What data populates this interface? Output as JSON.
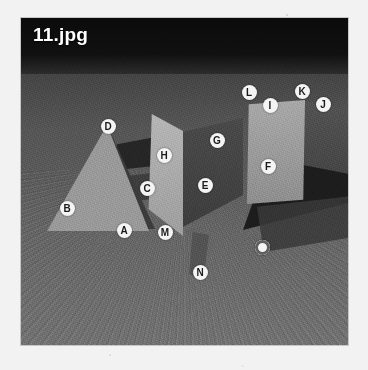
{
  "document": {
    "title": "11.jpg",
    "media_type": "photograph",
    "description": "Grayscale photograph of geometric solids on a textured ground plane with lettered annotation markers"
  },
  "photo": {
    "title_overlay": "11.jpg",
    "background_color": "#6e6e6e",
    "sky_color": "#0b0b0b",
    "ground_color": "#6b6b6b"
  },
  "scene": {
    "objects": [
      {
        "name": "pyramid",
        "position": "left",
        "shade": "light-gray"
      },
      {
        "name": "box",
        "position": "center",
        "shade": "light-gray-and-dark"
      },
      {
        "name": "tall-block",
        "position": "right",
        "shade": "light-gray"
      },
      {
        "name": "cast-shadow",
        "position": "right",
        "shade": "dark"
      }
    ]
  },
  "markers": [
    {
      "label": "A",
      "x": 124,
      "y": 230,
      "style": "letter"
    },
    {
      "label": "B",
      "x": 67,
      "y": 208,
      "style": "letter"
    },
    {
      "label": "C",
      "x": 147,
      "y": 188,
      "style": "letter"
    },
    {
      "label": "D",
      "x": 108,
      "y": 126,
      "style": "letter"
    },
    {
      "label": "E",
      "x": 205,
      "y": 185,
      "style": "letter"
    },
    {
      "label": "F",
      "x": 268,
      "y": 166,
      "style": "letter"
    },
    {
      "label": "G",
      "x": 217,
      "y": 140,
      "style": "letter"
    },
    {
      "label": "H",
      "x": 164,
      "y": 155,
      "style": "letter"
    },
    {
      "label": "I",
      "x": 270,
      "y": 105,
      "style": "letter"
    },
    {
      "label": "J",
      "x": 323,
      "y": 104,
      "style": "letter"
    },
    {
      "label": "K",
      "x": 302,
      "y": 91,
      "style": "letter"
    },
    {
      "label": "L",
      "x": 249,
      "y": 92,
      "style": "letter"
    },
    {
      "label": "M",
      "x": 165,
      "y": 232,
      "style": "letter"
    },
    {
      "label": "N",
      "x": 200,
      "y": 272,
      "style": "letter"
    },
    {
      "label": "O",
      "x": 262,
      "y": 247,
      "style": "ring"
    }
  ]
}
